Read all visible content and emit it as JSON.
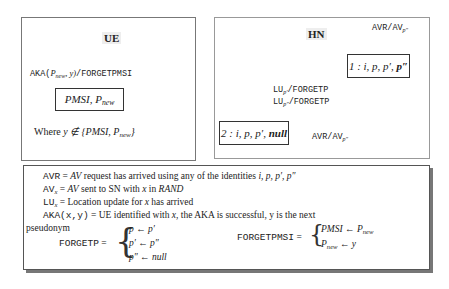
{
  "ue_panel": {
    "title": "UE",
    "transition_label_func": "AKA(",
    "transition_label_args": "P",
    "transition_label_args_sub": "new",
    "transition_label_y": ", y)",
    "transition_label_action": "/FORGETPMSI",
    "state_main": "PMSI, P",
    "state_sub": "new",
    "where_text": "Where ",
    "where_math": "y ∉ {PMSI, P",
    "where_sub": "new",
    "where_close": "}"
  },
  "hn_panel": {
    "title": "HN",
    "state1": {
      "prefix": "1 : i, p, p′, ",
      "bold": "p″"
    },
    "state2": {
      "prefix": "2 : i, p, p′, ",
      "bold": "null"
    },
    "self_loop_label": {
      "main": "AVR/AV",
      "sub": "p″"
    },
    "back_label": {
      "main": "AVR/AV",
      "sub": "p″"
    },
    "forget_labels": [
      {
        "main": "LU",
        "sub": "p′",
        "action": "/FORGETP"
      },
      {
        "main": "LU",
        "sub": "p″",
        "action": "/FORGETP"
      }
    ]
  },
  "legend": {
    "lines": [
      {
        "term": "AVR",
        "eq": " = ",
        "math": "AV",
        "text": " request has arrived using any of the identities ",
        "tail": "i, p, p′, p″"
      },
      {
        "term": "AV",
        "term_sub": "x",
        "eq": " = ",
        "math": "AV",
        "text": " sent to SN with ",
        "x": "x",
        "text2": " in ",
        "tail": "RAND"
      },
      {
        "term": "LU",
        "term_sub": "x",
        "eq": " = ",
        "text": "Location update for ",
        "x": "x",
        "text2": " has arrived"
      },
      {
        "term": "AKA(x,y)",
        "eq": " = ",
        "text": "UE identified with ",
        "x": "x",
        "text2": ", the AKA is successful, y is the next"
      }
    ],
    "wrap_word": "pseudonym",
    "forgetp": {
      "name": "FORGETP",
      "eq": " =",
      "cases": [
        "p ← p′",
        "p′ ← p″",
        "p″ ← null"
      ]
    },
    "forgetpmsi": {
      "name": "FORGETPMSI",
      "eq": " =",
      "cases": [
        {
          "lhs": "PMSI ← P",
          "sub": "new"
        },
        {
          "lhs": "P",
          "sub": "new",
          "rhs": " ← y"
        }
      ]
    }
  }
}
